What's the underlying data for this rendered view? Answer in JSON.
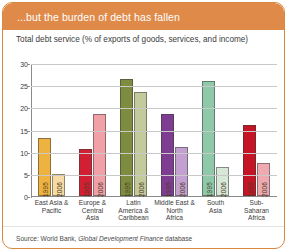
{
  "header": {
    "title": "...but the burden of debt has fallen"
  },
  "source": {
    "prefix": "Source: World Bank, ",
    "italic": "Global Development Finance",
    "suffix": " database"
  },
  "chart_data": {
    "type": "bar",
    "title": "Total debt service (% of exports of goods, services, and income)",
    "xlabel": "",
    "ylabel": "",
    "ylim": [
      0,
      30
    ],
    "yticks": [
      0,
      5,
      10,
      15,
      20,
      25,
      30
    ],
    "grid": true,
    "legend": "none",
    "categories": [
      "East Asia & Pacific",
      "Europe & Central Asia",
      "Latin America & Caribbean",
      "Middle East & North Africa",
      "South Asia",
      "Sub-Saharan Africa"
    ],
    "category_lines": [
      [
        "East Asia &",
        "Pacific"
      ],
      [
        "Europe &",
        "Central",
        "Asia"
      ],
      [
        "Latin",
        "America &",
        "Caribbean"
      ],
      [
        "Middle East &",
        "North",
        "Africa"
      ],
      [
        "South",
        "Asia"
      ],
      [
        "Sub-",
        "Saharan",
        "Africa"
      ]
    ],
    "series": [
      {
        "name": "1995",
        "values": [
          13.0,
          10.5,
          26.5,
          18.5,
          26.0,
          16.0
        ]
      },
      {
        "name": "2006",
        "values": [
          5.0,
          18.5,
          23.5,
          11.0,
          6.5,
          7.5
        ]
      }
    ],
    "group_colors": [
      {
        "1995": "#edb23f",
        "2006": "#f6dca4"
      },
      {
        "1995": "#d21f33",
        "2006": "#f2a0a8"
      },
      {
        "1995": "#7d8c3f",
        "2006": "#c3cb9c"
      },
      {
        "1995": "#7e3d91",
        "2006": "#c3a0cf"
      },
      {
        "1995": "#8fc9a9",
        "2006": "#d7e8d9"
      },
      {
        "1995": "#c41425",
        "2006": "#eeaab0"
      }
    ],
    "bar_labels": [
      "1995",
      "2006"
    ]
  },
  "colors": {
    "header_background": "#e08a4a",
    "header_text": "#ffffff",
    "panel_border": "#d8893f",
    "gridline": "#c9c9c9",
    "axis": "#8a8a8a",
    "text": "#3b3b3b"
  }
}
